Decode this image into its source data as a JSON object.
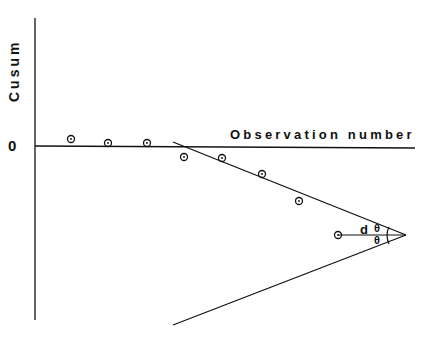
{
  "diagram": {
    "y_axis_label": "Cusum",
    "x_axis_label": "Observation number",
    "origin_label": "0",
    "lead_distance_label": "d",
    "angle_label_upper": "θ",
    "angle_label_lower": "θ",
    "points": [
      {
        "x": 71,
        "y": 139
      },
      {
        "x": 108,
        "y": 143
      },
      {
        "x": 147,
        "y": 143
      },
      {
        "x": 184,
        "y": 157
      },
      {
        "x": 222,
        "y": 158
      },
      {
        "x": 262,
        "y": 174
      },
      {
        "x": 299,
        "y": 201
      },
      {
        "x": 338,
        "y": 235
      }
    ],
    "vmask": {
      "vertex": {
        "x": 406,
        "y": 235
      },
      "upper_end": {
        "x": 173,
        "y": 142
      },
      "lower_end": {
        "x": 173,
        "y": 325
      }
    }
  }
}
